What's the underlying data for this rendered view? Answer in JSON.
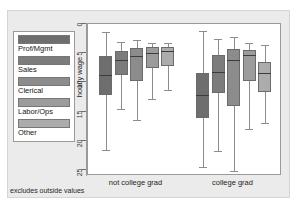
{
  "chart_data": {
    "type": "bar",
    "title": "",
    "subtitle": "",
    "xlabel": "",
    "ylabel": "hourly wage",
    "caption": "excludes outside values",
    "ylim": [
      0,
      26
    ],
    "y_inverted": true,
    "yticks": [
      0,
      5,
      10,
      15,
      20,
      25
    ],
    "ytick_labels": [
      "0",
      "5",
      "10",
      "15",
      "20",
      "25"
    ],
    "grid": false,
    "legend_position": "left-outside",
    "categories": [
      "not college grad",
      "college grad"
    ],
    "legend": [
      "Prof/Mgmt",
      "Sales",
      "Clerical",
      "Labor/Ops",
      "Other"
    ],
    "colors": [
      "#6e6e6e",
      "#7c7c7c",
      "#8c8c8c",
      "#9c9c9c",
      "#acacac"
    ],
    "series": [
      {
        "name": "Prof/Mgmt",
        "color": "#6e6e6e",
        "boxes": [
          {
            "group": "not college grad",
            "lower_whisker": 1.4,
            "q1": 5.4,
            "median": 8.7,
            "q3": 12.2,
            "upper_whisker": 21.5
          },
          {
            "group": "college grad",
            "lower_whisker": 1.2,
            "q1": 8.3,
            "median": 12.2,
            "q3": 16.0,
            "upper_whisker": 24.5
          }
        ]
      },
      {
        "name": "Sales",
        "color": "#7c7c7c",
        "boxes": [
          {
            "group": "not college grad",
            "lower_whisker": 3.1,
            "q1": 4.6,
            "median": 6.1,
            "q3": 8.8,
            "upper_whisker": 14.5
          },
          {
            "group": "college grad",
            "lower_whisker": 2.6,
            "q1": 5.3,
            "median": 8.2,
            "q3": 11.8,
            "upper_whisker": 21.8
          }
        ]
      },
      {
        "name": "Clerical",
        "color": "#8c8c8c",
        "boxes": [
          {
            "group": "not college grad",
            "lower_whisker": 2.7,
            "q1": 4.1,
            "median": 5.5,
            "q3": 9.8,
            "upper_whisker": 16.5
          },
          {
            "group": "college grad",
            "lower_whisker": 2.3,
            "q1": 4.2,
            "median": 6.1,
            "q3": 14.0,
            "upper_whisker": 25.2
          }
        ]
      },
      {
        "name": "Labor/Ops",
        "color": "#9c9c9c",
        "boxes": [
          {
            "group": "not college grad",
            "lower_whisker": 3.3,
            "q1": 4.0,
            "median": 4.9,
            "q3": 7.6,
            "upper_whisker": 12.8
          },
          {
            "group": "college grad",
            "lower_whisker": 3.2,
            "q1": 4.4,
            "median": 5.3,
            "q3": 9.7,
            "upper_whisker": 18.0
          }
        ]
      },
      {
        "name": "Other",
        "color": "#acacac",
        "boxes": [
          {
            "group": "not college grad",
            "lower_whisker": 3.3,
            "q1": 3.9,
            "median": 4.7,
            "q3": 7.1,
            "upper_whisker": 11.3
          },
          {
            "group": "college grad",
            "lower_whisker": 3.6,
            "q1": 6.5,
            "median": 8.4,
            "q3": 11.7,
            "upper_whisker": 17.0
          }
        ]
      }
    ]
  }
}
